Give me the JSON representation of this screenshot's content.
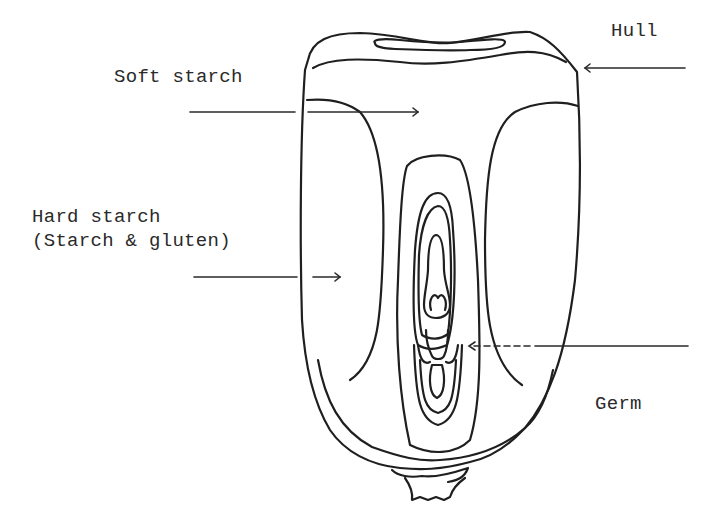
{
  "diagram": {
    "labels": {
      "hull": "Hull",
      "soft_starch": "Soft starch",
      "hard_starch_line1": "Hard starch",
      "hard_starch_line2": "(Starch & gluten)",
      "germ": "Germ"
    },
    "colors": {
      "stroke": "#1f1f1f",
      "text": "#2a2a2a",
      "background": "#ffffff"
    }
  }
}
